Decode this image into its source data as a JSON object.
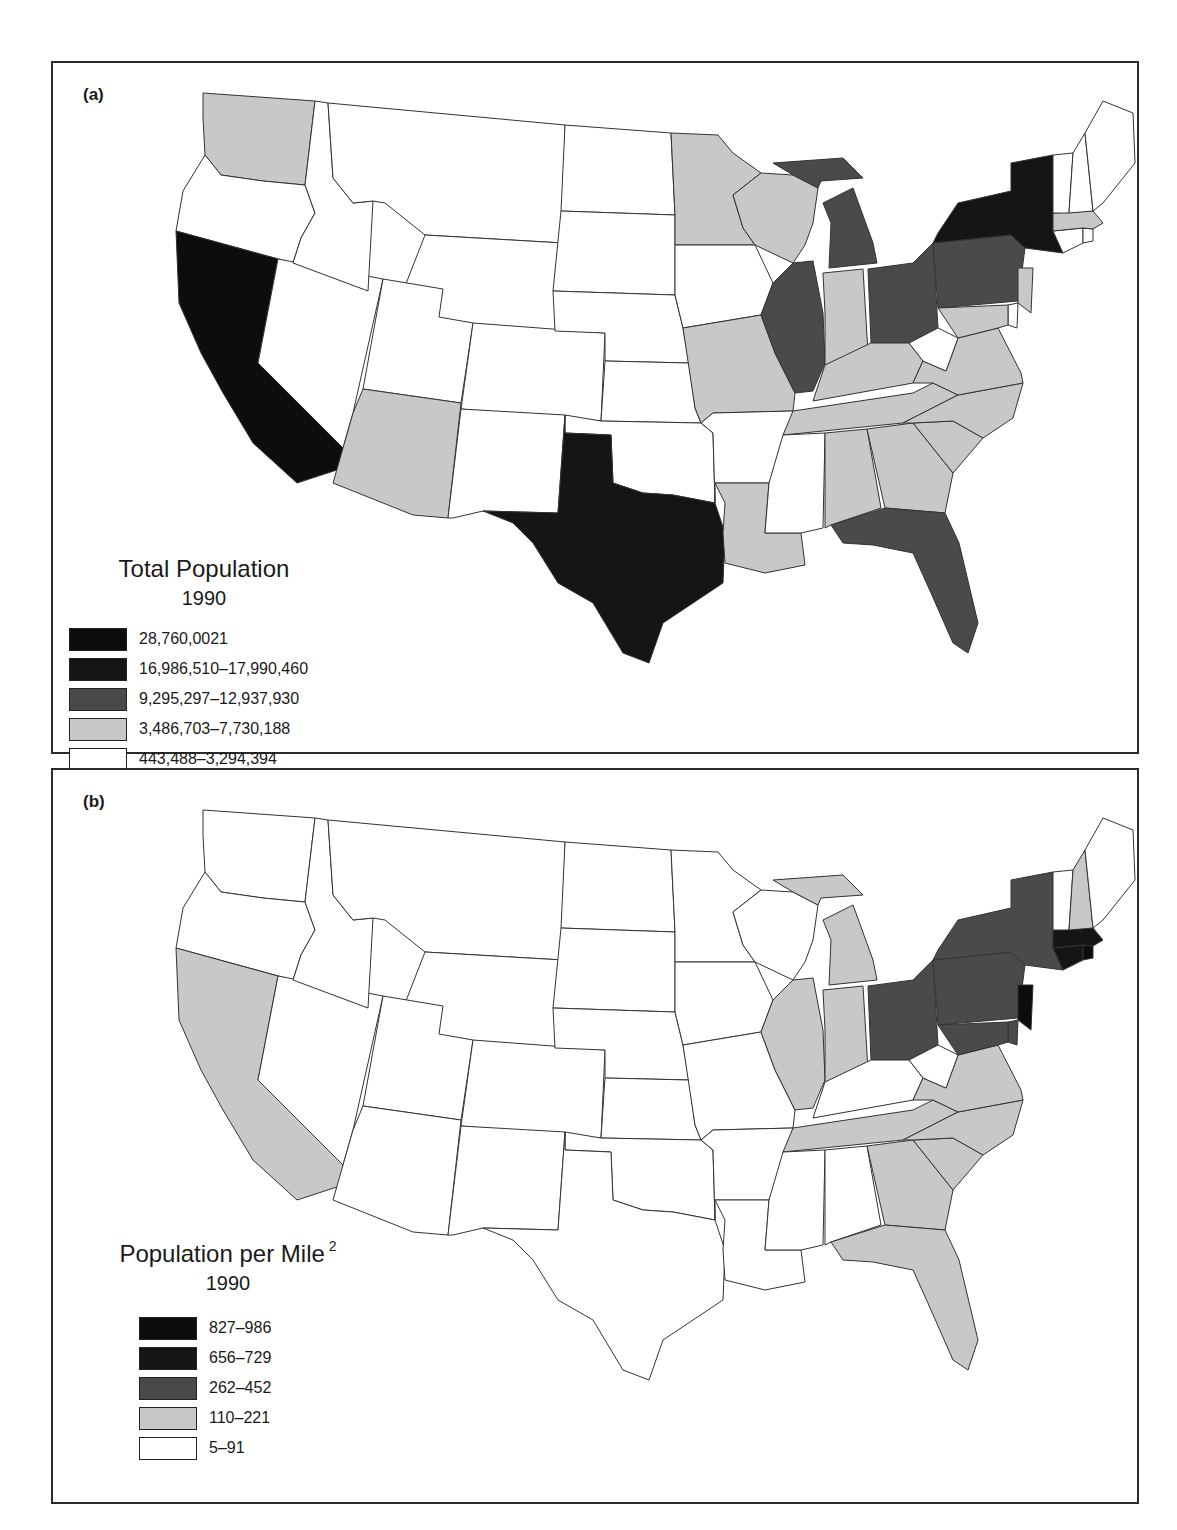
{
  "figure": {
    "panel_a": {
      "label": "(a)",
      "legend": {
        "title": "Total Population",
        "year": "1990",
        "items": [
          {
            "label": "28,760,0021",
            "color": "#0d0d0d"
          },
          {
            "label": "16,986,510–17,990,460",
            "color": "#151515"
          },
          {
            "label": "9,295,297–12,937,930",
            "color": "#4a4a4a"
          },
          {
            "label": "3,486,703–7,730,188",
            "color": "#c8c8c8"
          },
          {
            "label": "443,488–3,294,394",
            "color": "#ffffff"
          }
        ]
      }
    },
    "panel_b": {
      "label": "(b)",
      "legend": {
        "title": "Population per Mile",
        "title_superscript": "2",
        "year": "1990",
        "items": [
          {
            "label": "827–986",
            "color": "#0d0d0d"
          },
          {
            "label": "656–729",
            "color": "#151515"
          },
          {
            "label": "262–452",
            "color": "#4a4a4a"
          },
          {
            "label": "110–221",
            "color": "#c8c8c8"
          },
          {
            "label": "5–91",
            "color": "#ffffff"
          }
        ]
      }
    }
  },
  "chart_data": [
    {
      "type": "choropleth",
      "title": "Total Population 1990",
      "panel": "(a)",
      "classes": [
        "28,760,0021",
        "16,986,510–17,990,460",
        "9,295,297–12,937,930",
        "3,486,703–7,730,188",
        "443,488–3,294,394"
      ],
      "state_class": {
        "CA": 0,
        "TX": 1,
        "NY": 1,
        "FL": 2,
        "PA": 2,
        "IL": 2,
        "OH": 2,
        "MI": 2,
        "WA": 3,
        "AZ": 3,
        "MN": 3,
        "WI": 3,
        "MO": 3,
        "IN": 3,
        "TN": 3,
        "KY": 3,
        "LA": 3,
        "AL": 3,
        "GA": 3,
        "SC": 3,
        "NC": 3,
        "VA": 3,
        "MD": 3,
        "NJ": 3,
        "MA": 3,
        "OR": 4,
        "ID": 4,
        "MT": 4,
        "WY": 4,
        "NV": 4,
        "UT": 4,
        "CO": 4,
        "NM": 4,
        "ND": 4,
        "SD": 4,
        "NE": 4,
        "KS": 4,
        "OK": 4,
        "IA": 4,
        "AR": 4,
        "MS": 4,
        "WV": 4,
        "ME": 4,
        "NH": 4,
        "VT": 4,
        "CT": 4,
        "RI": 4,
        "DE": 4
      }
    },
    {
      "type": "choropleth",
      "title": "Population per Mile² 1990",
      "panel": "(b)",
      "classes": [
        "827–986",
        "656–729",
        "262–452",
        "110–221",
        "5–91"
      ],
      "state_class": {
        "NJ": 0,
        "RI": 0,
        "MA": 1,
        "CT": 1,
        "NY": 2,
        "PA": 2,
        "OH": 2,
        "MD": 2,
        "DE": 2,
        "CA": 3,
        "MI": 3,
        "IL": 3,
        "IN": 3,
        "TN": 3,
        "VA": 3,
        "NC": 3,
        "SC": 3,
        "GA": 3,
        "FL": 3,
        "NH": 3,
        "WA": 4,
        "OR": 4,
        "ID": 4,
        "MT": 4,
        "WY": 4,
        "NV": 4,
        "UT": 4,
        "CO": 4,
        "AZ": 4,
        "NM": 4,
        "ND": 4,
        "SD": 4,
        "NE": 4,
        "KS": 4,
        "OK": 4,
        "TX": 4,
        "MN": 4,
        "IA": 4,
        "MO": 4,
        "AR": 4,
        "LA": 4,
        "WI": 4,
        "KY": 4,
        "WV": 4,
        "MS": 4,
        "AL": 4,
        "ME": 4,
        "VT": 4
      }
    }
  ]
}
